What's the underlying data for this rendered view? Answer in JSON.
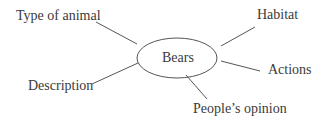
{
  "diagram": {
    "center": "Bears",
    "branches": [
      {
        "label": "Type of animal"
      },
      {
        "label": "Habitat"
      },
      {
        "label": "Actions"
      },
      {
        "label": "Description"
      },
      {
        "label": "People’s opinion"
      }
    ]
  }
}
